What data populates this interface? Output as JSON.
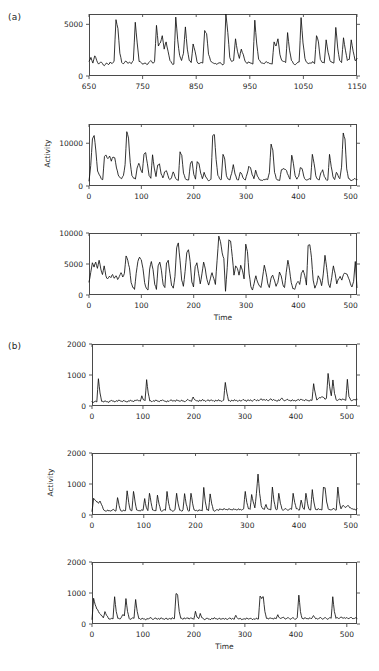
{
  "figure": {
    "group_a_label": "(a)",
    "group_b_label": "(b)"
  },
  "chart_data": [
    {
      "id": "a1",
      "type": "line",
      "title": "",
      "xlabel": "",
      "ylabel": "",
      "grid": false,
      "legend": "none",
      "xlim": [
        650,
        1150
      ],
      "ylim": [
        0,
        6000
      ],
      "xticks": [
        650,
        750,
        850,
        950,
        1050,
        1150
      ],
      "xticklabels": [
        "650",
        "750",
        "850",
        "950",
        "1050",
        "1150"
      ],
      "yticks": [
        0,
        5000
      ],
      "yticklabels": [
        "0",
        "5000"
      ],
      "x_start": 650,
      "x_step": 2.5,
      "values": [
        1450,
        1800,
        1250,
        1950,
        1500,
        1150,
        1350,
        1200,
        1000,
        1250,
        1100,
        1350,
        1200,
        1400,
        5450,
        4600,
        2200,
        1300,
        1200,
        1450,
        1250,
        1350,
        1200,
        1500,
        5200,
        3200,
        1400,
        1300,
        1150,
        1250,
        1100,
        1300,
        1500,
        1250,
        1400,
        4900,
        2900,
        3200,
        3900,
        2600,
        3300,
        2400,
        1500,
        1200,
        1150,
        5700,
        3500,
        2000,
        1500,
        2200,
        4750,
        2600,
        1500,
        1300,
        3100,
        2400,
        1400,
        1200,
        1300,
        1250,
        4400,
        4100,
        2100,
        1500,
        1300,
        1200,
        1150,
        1250,
        1300,
        1100,
        1200,
        6000,
        4200,
        1800,
        1400,
        1500,
        3600,
        2400,
        1700,
        2600,
        2100,
        1400,
        1200,
        1350,
        1250,
        1150,
        5400,
        3100,
        1600,
        1350,
        1250,
        1200,
        1400,
        1300,
        1200,
        1150,
        3300,
        2900,
        3600,
        2100,
        1500,
        1400,
        1300,
        4200,
        2500,
        1500,
        1200,
        1100,
        1250,
        1350,
        5650,
        3200,
        1700,
        1300,
        1200,
        1250,
        1400,
        1200,
        3900,
        3300,
        1600,
        1300,
        1250,
        3500,
        2300,
        1500,
        1350,
        1250,
        4700,
        2700,
        1500,
        1300,
        3700,
        2500,
        1500,
        1600,
        3500,
        2400,
        1500,
        1700
      ]
    },
    {
      "id": "a2",
      "type": "line",
      "title": "",
      "xlabel": "",
      "ylabel": "Activity",
      "grid": false,
      "legend": "none",
      "xlim": [
        0,
        512
      ],
      "ylim": [
        0,
        14500
      ],
      "xticks": [
        0,
        100,
        200,
        300,
        400,
        500
      ],
      "xticklabels": [
        "0",
        "100",
        "200",
        "300",
        "400",
        "500"
      ],
      "yticks": [
        0,
        10000
      ],
      "yticklabels": [
        "0",
        "10000"
      ],
      "x_start": 0,
      "x_step": 2.6,
      "values": [
        1200,
        4800,
        11000,
        11800,
        8200,
        3500,
        2600,
        1800,
        1500,
        6900,
        7200,
        6400,
        7000,
        5800,
        6800,
        6600,
        4200,
        2600,
        2000,
        1700,
        2400,
        5000,
        12700,
        11200,
        5500,
        2400,
        1800,
        1600,
        4200,
        5300,
        4000,
        3100,
        7400,
        7800,
        5200,
        2400,
        1800,
        7300,
        4200,
        2200,
        4900,
        5200,
        2800,
        1900,
        3300,
        3600,
        2400,
        1500,
        1900,
        3300,
        2200,
        1500,
        1300,
        8000,
        7200,
        3000,
        1800,
        1500,
        1400,
        5100,
        5800,
        2700,
        1600,
        5700,
        5300,
        3000,
        1700,
        3200,
        2100,
        1500,
        1300,
        1600,
        11700,
        12000,
        6200,
        2500,
        1700,
        1500,
        7400,
        6300,
        2400,
        1600,
        1400,
        2900,
        5000,
        2800,
        1600,
        1400,
        3200,
        2700,
        1700,
        1400,
        2800,
        4600,
        4300,
        2600,
        1700,
        3700,
        2300,
        1600,
        1400,
        1300,
        1500,
        1700,
        1500,
        3100,
        9800,
        8400,
        3200,
        1700,
        1400,
        1300,
        3800,
        4100,
        3900,
        3600,
        2500,
        1600,
        7200,
        5200,
        2400,
        1600,
        2200,
        4300,
        4100,
        2300,
        1500,
        1400,
        1600,
        1500,
        7400,
        5300,
        2400,
        1600,
        1400,
        3100,
        3800,
        2200,
        1500,
        1400,
        7400,
        4500,
        2200,
        1500,
        3200,
        2400,
        1700,
        4400,
        12400,
        11000,
        4000,
        1800,
        1400,
        1300,
        1500,
        1700,
        1500
      ]
    },
    {
      "id": "a3",
      "type": "line",
      "title": "",
      "xlabel": "Time",
      "ylabel": "",
      "grid": false,
      "legend": "none",
      "xlim": [
        0,
        512
      ],
      "ylim": [
        0,
        10000
      ],
      "xticks": [
        0,
        100,
        200,
        300,
        400,
        500
      ],
      "xticklabels": [
        "0",
        "100",
        "200",
        "300",
        "400",
        "500"
      ],
      "yticks": [
        0,
        5000,
        10000
      ],
      "yticklabels": [
        "0",
        "5000",
        "10000"
      ],
      "x_start": 0,
      "x_step": 2.6,
      "values": [
        2100,
        3600,
        5200,
        4500,
        5300,
        4300,
        5600,
        4200,
        3300,
        4700,
        3100,
        2600,
        3000,
        2800,
        3300,
        2700,
        3100,
        2500,
        3000,
        3600,
        2900,
        3500,
        6300,
        5600,
        4400,
        2000,
        1200,
        900,
        3500,
        5400,
        6100,
        5700,
        4300,
        2000,
        1100,
        800,
        4200,
        5400,
        4100,
        1700,
        900,
        4700,
        5300,
        3900,
        1700,
        1200,
        5200,
        5600,
        3500,
        1500,
        1100,
        3000,
        7600,
        8400,
        5600,
        2400,
        1400,
        3800,
        6800,
        7300,
        5400,
        2100,
        1300,
        4600,
        5200,
        3500,
        1800,
        3400,
        5300,
        4200,
        2500,
        1600,
        2600,
        3600,
        2700,
        1700,
        5600,
        9500,
        8600,
        6800,
        5900,
        600,
        4400,
        8900,
        8700,
        6200,
        3200,
        4700,
        4300,
        3200,
        4800,
        4000,
        2600,
        8200,
        7000,
        3400,
        1400,
        800,
        1900,
        3100,
        2100,
        1500,
        1200,
        2900,
        4800,
        3600,
        1900,
        1200,
        2700,
        3200,
        2400,
        1400,
        2000,
        3700,
        3100,
        1700,
        1200,
        3600,
        5600,
        4000,
        2000,
        1000,
        900,
        1800,
        2200,
        1700,
        3500,
        4000,
        3100,
        1600,
        8000,
        8100,
        6000,
        2400,
        1100,
        1700,
        3100,
        2600,
        1500,
        3400,
        6400,
        4400,
        1900,
        1200,
        2800,
        4700,
        3500,
        1800,
        2600,
        3000,
        2400,
        3300,
        3500,
        3400,
        2700,
        1900,
        1300,
        2200,
        5400,
        1200
      ]
    },
    {
      "id": "b1",
      "type": "line",
      "title": "",
      "xlabel": "",
      "ylabel": "",
      "grid": false,
      "legend": "none",
      "xlim": [
        0,
        520
      ],
      "ylim": [
        0,
        2000
      ],
      "xticks": [
        0,
        100,
        200,
        300,
        400,
        500
      ],
      "xticklabels": [
        "0",
        "100",
        "200",
        "300",
        "400",
        "500"
      ],
      "yticks": [
        0,
        1000,
        2000
      ],
      "yticklabels": [
        "0",
        "1000",
        "2000"
      ],
      "x_start": 0,
      "x_step": 2.6,
      "values": [
        140,
        120,
        160,
        130,
        880,
        420,
        150,
        130,
        170,
        140,
        120,
        160,
        180,
        150,
        130,
        170,
        150,
        190,
        160,
        140,
        180,
        150,
        130,
        170,
        190,
        160,
        140,
        180,
        200,
        170,
        150,
        330,
        200,
        170,
        850,
        420,
        160,
        140,
        170,
        150,
        190,
        160,
        140,
        180,
        200,
        160,
        140,
        170,
        150,
        190,
        160,
        180,
        150,
        200,
        170,
        150,
        190,
        160,
        140,
        180,
        200,
        170,
        150,
        290,
        200,
        170,
        150,
        190,
        160,
        210,
        180,
        150,
        190,
        160,
        200,
        170,
        150,
        190,
        160,
        200,
        170,
        150,
        190,
        760,
        420,
        170,
        150,
        190,
        160,
        200,
        180,
        150,
        190,
        170,
        210,
        180,
        150,
        200,
        170,
        190,
        160,
        210,
        180,
        200,
        170,
        220,
        190,
        210,
        180,
        200,
        170,
        230,
        190,
        210,
        180,
        160,
        200,
        180,
        250,
        200,
        170,
        190,
        210,
        180,
        160,
        200,
        180,
        160,
        200,
        180,
        220,
        190,
        170,
        210,
        180,
        160,
        200,
        180,
        720,
        420,
        190,
        240,
        260,
        300,
        280,
        220,
        260,
        1050,
        620,
        330,
        840,
        400,
        200,
        180,
        220,
        190,
        230,
        200,
        180,
        860,
        300,
        200,
        180,
        210,
        190,
        220
      ]
    },
    {
      "id": "b2",
      "type": "line",
      "title": "",
      "xlabel": "",
      "ylabel": "Activity",
      "grid": false,
      "legend": "none",
      "xlim": [
        0,
        512
      ],
      "ylim": [
        0,
        2000
      ],
      "xticks": [
        0,
        100,
        200,
        300,
        400,
        500
      ],
      "xticklabels": [
        "0",
        "100",
        "200",
        "300",
        "400",
        "500"
      ],
      "yticks": [
        0,
        1000,
        2000
      ],
      "yticklabels": [
        "0",
        "1000",
        "2000"
      ],
      "x_start": 0,
      "x_step": 2.6,
      "values": [
        120,
        540,
        480,
        420,
        380,
        450,
        330,
        200,
        140,
        120,
        160,
        140,
        130,
        170,
        150,
        130,
        560,
        300,
        140,
        120,
        160,
        140,
        780,
        400,
        160,
        140,
        760,
        420,
        160,
        140,
        130,
        170,
        150,
        530,
        250,
        140,
        700,
        400,
        160,
        140,
        130,
        640,
        350,
        150,
        130,
        170,
        150,
        760,
        380,
        160,
        140,
        130,
        170,
        700,
        360,
        150,
        130,
        170,
        690,
        350,
        150,
        130,
        700,
        380,
        160,
        140,
        130,
        170,
        150,
        130,
        890,
        420,
        160,
        140,
        680,
        360,
        150,
        130,
        170,
        150,
        200,
        180,
        160,
        200,
        180,
        160,
        200,
        180,
        160,
        200,
        180,
        160,
        200,
        180,
        160,
        200,
        760,
        400,
        200,
        180,
        660,
        420,
        230,
        700,
        1320,
        700,
        300,
        200,
        180,
        340,
        200,
        180,
        160,
        900,
        450,
        200,
        180,
        700,
        380,
        180,
        160,
        200,
        180,
        160,
        200,
        180,
        700,
        400,
        200,
        180,
        160,
        480,
        250,
        180,
        700,
        380,
        180,
        160,
        820,
        420,
        180,
        160,
        200,
        180,
        160,
        900,
        880,
        420,
        200,
        180,
        160,
        200,
        180,
        160,
        900,
        420,
        200,
        300,
        280,
        250,
        300,
        280,
        230,
        200,
        180,
        160,
        200
      ]
    },
    {
      "id": "b3",
      "type": "line",
      "title": "",
      "xlabel": "Time",
      "ylabel": "",
      "grid": false,
      "legend": "none",
      "xlim": [
        0,
        520
      ],
      "ylim": [
        0,
        2000
      ],
      "xticks": [
        0,
        100,
        200,
        300,
        400,
        500
      ],
      "xticklabels": [
        "0",
        "100",
        "200",
        "300",
        "400",
        "500"
      ],
      "yticks": [
        0,
        1000,
        2000
      ],
      "yticklabels": [
        "0",
        "1000",
        "2000"
      ],
      "x_start": 0,
      "x_step": 2.6,
      "values": [
        150,
        830,
        620,
        480,
        400,
        330,
        260,
        200,
        400,
        280,
        200,
        160,
        180,
        160,
        880,
        400,
        180,
        160,
        200,
        300,
        260,
        820,
        400,
        180,
        160,
        200,
        180,
        790,
        400,
        170,
        150,
        190,
        160,
        140,
        180,
        160,
        200,
        170,
        150,
        190,
        160,
        180,
        150,
        200,
        170,
        150,
        190,
        160,
        180,
        150,
        200,
        170,
        980,
        930,
        400,
        180,
        160,
        200,
        170,
        190,
        160,
        200,
        170,
        150,
        410,
        220,
        170,
        340,
        200,
        170,
        150,
        190,
        160,
        140,
        180,
        160,
        200,
        170,
        150,
        190,
        160,
        180,
        150,
        170,
        150,
        190,
        160,
        180,
        150,
        280,
        190,
        160,
        180,
        150,
        170,
        150,
        190,
        160,
        180,
        150,
        170,
        150,
        190,
        160,
        900,
        820,
        880,
        400,
        180,
        160,
        200,
        180,
        160,
        200,
        170,
        300,
        200,
        180,
        210,
        190,
        160,
        200,
        180,
        160,
        200,
        180,
        160,
        200,
        930,
        400,
        180,
        160,
        200,
        180,
        160,
        200,
        180,
        270,
        200,
        180,
        160,
        200,
        180,
        160,
        200,
        180,
        160,
        200,
        180,
        880,
        400,
        180,
        200,
        180,
        220,
        190,
        210,
        180,
        200,
        180,
        210,
        190,
        180,
        200,
        180
      ]
    }
  ]
}
